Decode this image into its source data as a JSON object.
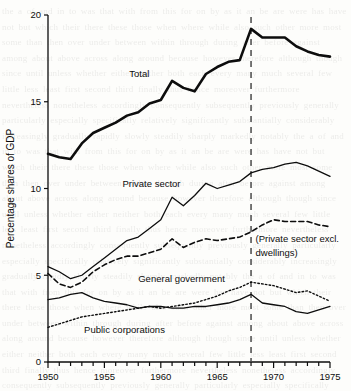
{
  "chart_data": {
    "type": "line",
    "title": "",
    "xlabel": "",
    "ylabel": "Percentage shares of GDP",
    "xlim": [
      1950,
      1975
    ],
    "ylim": [
      0,
      20
    ],
    "ytick_values": [
      0,
      5,
      10,
      15,
      20
    ],
    "ytick_labels": [
      "0",
      "5",
      "10",
      "15",
      "20"
    ],
    "xtick_labels": [
      "1950",
      "1955",
      "1960",
      "1965",
      "1970",
      "1975"
    ],
    "xtick_values": [
      1950,
      1955,
      1960,
      1965,
      1970,
      1975
    ],
    "minor_xticks_every": 1,
    "grid": false,
    "legend_position": "inline-annotations",
    "x": [
      1950,
      1951,
      1952,
      1953,
      1954,
      1955,
      1956,
      1957,
      1958,
      1959,
      1960,
      1961,
      1962,
      1963,
      1964,
      1965,
      1966,
      1967,
      1968,
      1969,
      1970,
      1971,
      1972,
      1973,
      1974,
      1975
    ],
    "series": [
      {
        "name": "Total",
        "style": "thick-solid",
        "label": "Total",
        "values": [
          12.0,
          11.8,
          11.7,
          12.6,
          13.2,
          13.5,
          13.8,
          14.2,
          14.4,
          14.9,
          15.1,
          16.2,
          15.8,
          15.6,
          16.6,
          17.0,
          17.3,
          17.4,
          19.2,
          18.7,
          18.7,
          18.7,
          18.2,
          17.9,
          17.7,
          17.6
        ]
      },
      {
        "name": "Private sector",
        "style": "thin-solid",
        "label": "Private sector",
        "values": [
          5.5,
          5.2,
          4.8,
          5.0,
          5.5,
          6.0,
          6.5,
          7.0,
          7.2,
          7.7,
          8.2,
          9.5,
          9.0,
          9.6,
          10.3,
          10.0,
          10.2,
          10.4,
          10.9,
          11.1,
          11.2,
          11.4,
          11.5,
          11.3,
          11.0,
          10.7
        ]
      },
      {
        "name": "Private sector excl. dwellings",
        "style": "dashed",
        "label": "(Private sector excl. dwellings)",
        "values": [
          5.1,
          4.5,
          4.3,
          4.6,
          5.2,
          5.6,
          5.9,
          6.1,
          6.1,
          6.3,
          6.5,
          7.1,
          6.6,
          6.9,
          7.1,
          7.0,
          7.1,
          7.2,
          7.5,
          7.9,
          8.2,
          8.1,
          8.1,
          8.1,
          7.9,
          7.8
        ]
      },
      {
        "name": "General government",
        "style": "thin-solid-lower",
        "label": "General government",
        "values": [
          3.6,
          3.7,
          3.9,
          4.0,
          3.7,
          3.5,
          3.4,
          3.3,
          3.1,
          3.2,
          3.2,
          3.1,
          3.1,
          3.2,
          3.2,
          3.3,
          3.4,
          3.6,
          3.9,
          3.4,
          3.3,
          3.2,
          2.9,
          2.8,
          3.0,
          3.2
        ]
      },
      {
        "name": "Public corporations",
        "style": "dotted",
        "label": "Public corporations",
        "values": [
          2.0,
          2.2,
          2.4,
          2.6,
          2.7,
          2.8,
          2.9,
          3.0,
          3.1,
          3.2,
          3.1,
          3.2,
          3.3,
          3.4,
          3.6,
          3.8,
          4.1,
          4.3,
          4.6,
          4.5,
          4.4,
          4.2,
          4.0,
          4.1,
          3.8,
          3.5
        ]
      }
    ],
    "reference_line": {
      "name": "year-1968-marker",
      "x": 1968,
      "style": "dashed-vertical"
    },
    "annotations": [
      {
        "name": "total-label",
        "text": "Total",
        "x": 1957.2,
        "y": 16.4
      },
      {
        "name": "private-sector-label",
        "text": "Private sector",
        "x": 1956.6,
        "y": 10.1
      },
      {
        "name": "private-excl-dwellings-label-line1",
        "text": "(Private sector excl.",
        "x": 1968.4,
        "y": 6.9
      },
      {
        "name": "private-excl-dwellings-label-line2",
        "text": "dwellings)",
        "x": 1968.4,
        "y": 6.1
      },
      {
        "name": "general-government-label",
        "text": "General government",
        "x": 1958.0,
        "y": 4.6
      },
      {
        "name": "public-corporations-label",
        "text": "Public corporations",
        "x": 1953.2,
        "y": 1.7
      }
    ]
  },
  "page_bleed": {
    "text": "the a of and in to was that with from this for on by as it an be are were has have not but which their there these those when where while also such other more most some than then over under between within through during after before against among about above across along around because however therefore although though since until unless whether either neither both each every many much several few little less least first second third finally thus hence moreover furthermore nevertheless nonetheless accordingly consequently subsequently previously generally particularly especially specifically relatively significantly substantially considerably increasingly gradually rapidly slowly steadily sharply markedly notably the a of and in to was that with from this for on by as it an be are were has have not but which their there these those when where while also such other more most some than then over under between within through during after before against among about above across along around because however therefore although though since until unless whether either neither both each every many much several few little less least first second third finally thus hence moreover furthermore nevertheless nonetheless accordingly consequently subsequently previously generally particularly especially specifically relatively significantly substantially considerably increasingly gradually rapidly slowly steadily sharply markedly notably the a of and in to was that with from this for on by as it an be are were has have not but which their there these those when where while also such other more most some than then over under between within through during after before against among about above across along around because however therefore although though since until unless whether either neither both each every many much several few little less least first second third finally thus hence moreover furthermore nevertheless nonetheless accordingly consequently subsequently previously generally particularly especially specifically relatively significantly substantially considerably increasingly gradually rapidly slowly steadily sharply markedly notably the a of and in to was that with from this for on by as it an be are were has have not but which their there these those when where while also such other more most some than then over under between within through during after before against among about above across along around because however therefore although though since until unless whether either neither both each every many much several few little less least first second third finally thus hence"
  },
  "colors": {
    "ink": "#0d0d0d",
    "paper": "#fdfdfb",
    "reference_line": "#4a4a4a"
  }
}
